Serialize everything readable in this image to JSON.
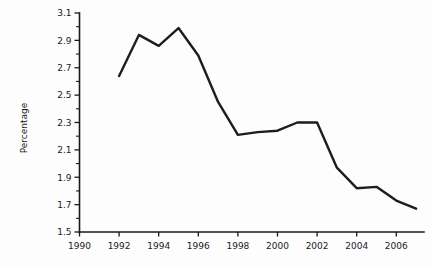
{
  "chart_data": {
    "type": "line",
    "title": "",
    "subtitle": "",
    "xlabel": "",
    "ylabel": "Percentage",
    "xlim": [
      1990,
      2007.4
    ],
    "ylim": [
      1.5,
      3.1
    ],
    "grid": false,
    "legend": "none",
    "x_tick_labels": [
      "1990",
      "1992",
      "1994",
      "1996",
      "1998",
      "2000",
      "2002",
      "2004",
      "2006"
    ],
    "x_tick_values": [
      1990,
      1992,
      1994,
      1996,
      1998,
      2000,
      2002,
      2004,
      2006
    ],
    "x_minor_tick_values": [
      1991,
      1993,
      1995,
      1997,
      1999,
      2001,
      2003,
      2005,
      2007
    ],
    "y_tick_labels": [
      "1.5",
      "1.7",
      "1.9",
      "2.1",
      "2.3",
      "2.5",
      "2.7",
      "2.9",
      "3.1"
    ],
    "y_tick_values": [
      1.5,
      1.7,
      1.9,
      2.1,
      2.3,
      2.5,
      2.7,
      2.9,
      3.1
    ],
    "y_minor_tick_values": [
      1.6,
      1.8,
      2.0,
      2.2,
      2.4,
      2.6,
      2.8,
      3.0
    ],
    "x": [
      1992,
      1993,
      1994,
      1995,
      1996,
      1997,
      1998,
      1999,
      2000,
      2001,
      2002,
      2003,
      2004,
      2005,
      2006,
      2007
    ],
    "values": [
      2.64,
      2.94,
      2.86,
      2.99,
      2.79,
      2.45,
      2.21,
      2.23,
      2.24,
      2.3,
      2.3,
      1.97,
      1.82,
      1.83,
      1.73,
      1.67
    ],
    "series": [
      {
        "name": "Percentage",
        "color": "#1d1d1d",
        "values": [
          2.64,
          2.94,
          2.86,
          2.99,
          2.79,
          2.45,
          2.21,
          2.23,
          2.24,
          2.3,
          2.3,
          1.97,
          1.82,
          1.83,
          1.73,
          1.67
        ]
      }
    ]
  },
  "colors": {
    "line": "#1d1d1d",
    "axis": "#1a1a1a",
    "background": "#fdfdfd",
    "text": "#1a1a1a"
  }
}
